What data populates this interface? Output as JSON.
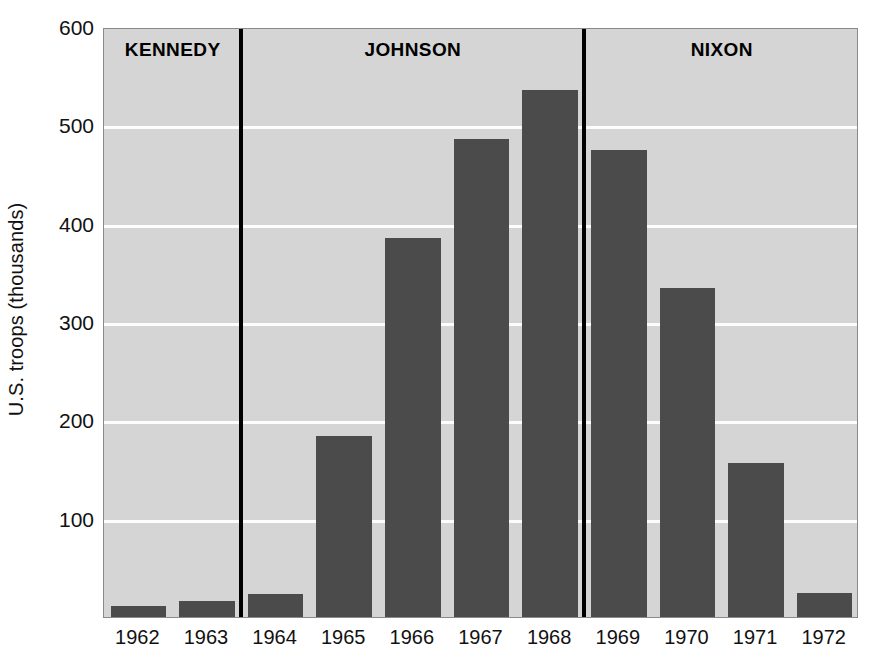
{
  "chart_data": {
    "type": "bar",
    "title": "",
    "subtitle": "",
    "xlabel": "",
    "ylabel": "U.S. troops (thousands)",
    "categories": [
      "1962",
      "1963",
      "1964",
      "1965",
      "1966",
      "1967",
      "1968",
      "1969",
      "1970",
      "1971",
      "1972"
    ],
    "values": [
      11,
      16,
      23,
      184,
      385,
      486,
      536,
      475,
      335,
      157,
      24
    ],
    "ylim": [
      0,
      600
    ],
    "yticks": [
      100,
      200,
      300,
      400,
      500,
      600
    ],
    "ytick_labels": [
      "100",
      "200",
      "300",
      "400",
      "500",
      "600"
    ],
    "grid": true,
    "legend": "none",
    "bar_color": "#4b4b4b",
    "plot_background": "#d5d5d5",
    "gridline_color": "#ffffff",
    "annotations": [
      {
        "label": "KENNEDY",
        "years": [
          "1962",
          "1963"
        ]
      },
      {
        "label": "JOHNSON",
        "years": [
          "1964",
          "1965",
          "1966",
          "1967",
          "1968"
        ]
      },
      {
        "label": "NIXON",
        "years": [
          "1969",
          "1970",
          "1971",
          "1972"
        ]
      }
    ],
    "dividers": [
      {
        "after_category": "1963"
      },
      {
        "after_category": "1968"
      }
    ]
  }
}
